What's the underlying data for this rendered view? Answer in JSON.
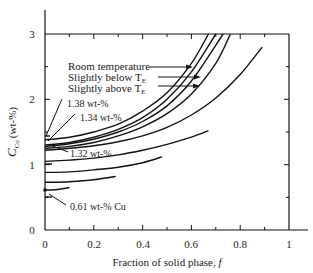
{
  "chart_data": {
    "type": "line",
    "title": "",
    "xlabel": "Fraction of solid phase, f",
    "ylabel": "C_Cu (wt-%)",
    "xlim": [
      0,
      1
    ],
    "ylim": [
      0,
      3
    ],
    "x_ticks": [
      "0",
      "0.2",
      "0.4",
      "0.6",
      "0.8",
      "1"
    ],
    "y_ticks": [
      "0",
      "1",
      "2",
      "3"
    ],
    "grid": false,
    "legend": [
      {
        "label": "Room temperature",
        "italic_part": ""
      },
      {
        "label": "Slightly below T",
        "subscript": "E"
      },
      {
        "label": "Slightly above T",
        "subscript": "E"
      }
    ],
    "annotations": [
      "1.38 wt-%",
      "1.34 wt-%",
      "1.32 wt-%",
      "0.61 wt-% Cu"
    ],
    "series": [
      {
        "name": "Room temperature",
        "x": [
          0,
          0.1,
          0.2,
          0.3,
          0.4,
          0.5,
          0.6,
          0.67
        ],
        "y": [
          1.38,
          1.42,
          1.5,
          1.62,
          1.82,
          2.1,
          2.55,
          3.0
        ]
      },
      {
        "name": "Slightly below TE",
        "x": [
          0,
          0.1,
          0.2,
          0.3,
          0.4,
          0.5,
          0.6,
          0.7
        ],
        "y": [
          1.3,
          1.34,
          1.42,
          1.54,
          1.72,
          2.0,
          2.42,
          3.0
        ]
      },
      {
        "name": "Slightly above TE",
        "x": [
          0,
          0.1,
          0.2,
          0.3,
          0.4,
          0.5,
          0.6,
          0.73
        ],
        "y": [
          1.28,
          1.32,
          1.39,
          1.5,
          1.66,
          1.9,
          2.28,
          3.0
        ]
      },
      {
        "name": "curve 4",
        "x": [
          0,
          0.1,
          0.2,
          0.3,
          0.4,
          0.5,
          0.6,
          0.7,
          0.76
        ],
        "y": [
          1.25,
          1.28,
          1.34,
          1.44,
          1.58,
          1.78,
          2.08,
          2.55,
          3.0
        ]
      },
      {
        "name": "curve 5",
        "x": [
          0,
          0.1,
          0.2,
          0.3,
          0.4,
          0.5,
          0.6,
          0.7,
          0.8,
          0.89
        ],
        "y": [
          1.22,
          1.25,
          1.29,
          1.35,
          1.44,
          1.57,
          1.76,
          2.02,
          2.38,
          2.8
        ]
      },
      {
        "name": "curve 6",
        "x": [
          0,
          0.1,
          0.2,
          0.3,
          0.4,
          0.5,
          0.6,
          0.67
        ],
        "y": [
          1.05,
          1.07,
          1.1,
          1.15,
          1.22,
          1.31,
          1.42,
          1.52
        ]
      },
      {
        "name": "curve 7",
        "x": [
          0,
          0.1,
          0.2,
          0.3,
          0.4,
          0.48
        ],
        "y": [
          0.88,
          0.89,
          0.92,
          0.96,
          1.03,
          1.12
        ]
      },
      {
        "name": "curve 8",
        "x": [
          0,
          0.1,
          0.2,
          0.29
        ],
        "y": [
          0.73,
          0.74,
          0.77,
          0.82
        ]
      },
      {
        "name": "curve 9 (0.61 wt-% Cu)",
        "x": [
          0,
          0.05,
          0.1
        ],
        "y": [
          0.61,
          0.62,
          0.65
        ]
      }
    ]
  },
  "labels": {
    "legend_room": "Room temperature",
    "legend_below": "Slightly below T",
    "legend_above": "Slightly above T",
    "sub_e": "E",
    "ann_138": "1.38 wt-%",
    "ann_134": "1.34 wt-%",
    "ann_132": "1.32 wt-%",
    "ann_061": "0.61 wt-% Cu",
    "xlabel": "Fraction of solid phase, ",
    "xlabel_var": "f",
    "ylabel_main": "C",
    "ylabel_sub": "Cu",
    "ylabel_unit": "(wt-%)",
    "x0": "0",
    "x02": "0.2",
    "x04": "0.4",
    "x06": "0.6",
    "x08": "0.8",
    "x1": "1",
    "y0": "0",
    "y1": "1",
    "y2": "2",
    "y3": "3"
  }
}
